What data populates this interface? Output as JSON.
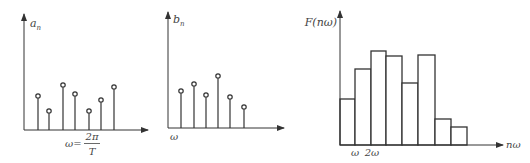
{
  "chart_data": [
    {
      "type": "stem",
      "title": "",
      "ylabel": "a_n",
      "ylabel_main": "a",
      "ylabel_sub": "n",
      "xlabel": "ω = 2π/T",
      "xlabel_lhs": "ω=",
      "xlabel_num": "2π",
      "xlabel_den": "T",
      "categories": [
        1,
        2,
        3,
        4,
        5,
        6,
        7
      ],
      "values": [
        34,
        19,
        45,
        36,
        19,
        30,
        43
      ],
      "grid": false
    },
    {
      "type": "stem",
      "title": "",
      "ylabel": "b_n",
      "ylabel_main": "b",
      "ylabel_sub": "n",
      "xlabel": "ω",
      "categories": [
        1,
        2,
        3,
        4,
        5,
        6
      ],
      "values": [
        37,
        44,
        33,
        52,
        31,
        21
      ],
      "grid": false
    },
    {
      "type": "bar",
      "title": "",
      "ylabel": "F(nω)",
      "xlabel": "nω",
      "tick_labels": [
        "ω",
        "2ω"
      ],
      "categories": [
        1,
        2,
        3,
        4,
        5,
        6,
        7,
        8
      ],
      "values": [
        46,
        76,
        94,
        89,
        62,
        90,
        26,
        18
      ],
      "grid": false
    }
  ]
}
